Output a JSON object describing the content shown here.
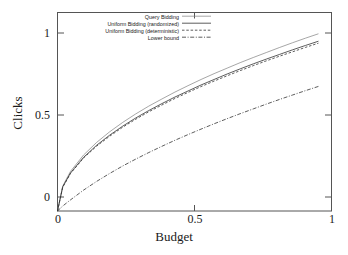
{
  "chart_data": {
    "type": "line",
    "title": "",
    "xlabel": "Budget",
    "ylabel": "Clicks",
    "xlim": [
      0,
      1.05
    ],
    "ylim": [
      0,
      1.12
    ],
    "xticks": [
      "0",
      "0.5",
      "1"
    ],
    "xtick_values": [
      0,
      0.5,
      1
    ],
    "yticks": [
      "0",
      "0.5",
      "1"
    ],
    "ytick_values": [
      0,
      0.5,
      1
    ],
    "grid": false,
    "legend_position": "top-right-inside",
    "frame": true,
    "series": [
      {
        "name": "Query Bidding",
        "style": "solid-thin",
        "color": "#808080",
        "x": [
          0,
          0.02,
          0.05,
          0.1,
          0.15,
          0.2,
          0.25,
          0.3,
          0.35,
          0.4,
          0.45,
          0.5,
          0.55,
          0.6,
          0.65,
          0.7,
          0.75,
          0.8,
          0.85,
          0.9,
          0.95,
          1.0
        ],
        "y": [
          0,
          0.141,
          0.224,
          0.316,
          0.387,
          0.447,
          0.5,
          0.548,
          0.592,
          0.632,
          0.671,
          0.707,
          0.742,
          0.775,
          0.806,
          0.837,
          0.866,
          0.894,
          0.922,
          0.949,
          0.975,
          1.0
        ]
      },
      {
        "name": "Uniform Bidding (randomized)",
        "style": "solid",
        "color": "#333333",
        "x": [
          0,
          0.02,
          0.05,
          0.1,
          0.15,
          0.2,
          0.25,
          0.3,
          0.35,
          0.4,
          0.45,
          0.5,
          0.55,
          0.6,
          0.65,
          0.7,
          0.75,
          0.8,
          0.85,
          0.9,
          0.95,
          1.0
        ],
        "y": [
          0,
          0.136,
          0.215,
          0.303,
          0.371,
          0.428,
          0.479,
          0.525,
          0.567,
          0.606,
          0.643,
          0.677,
          0.711,
          0.742,
          0.773,
          0.802,
          0.83,
          0.857,
          0.883,
          0.909,
          0.934,
          0.958
        ]
      },
      {
        "name": "Uniform Bidding (deterministic)",
        "style": "dashed",
        "color": "#333333",
        "x": [
          0,
          0.02,
          0.05,
          0.1,
          0.15,
          0.2,
          0.25,
          0.3,
          0.35,
          0.4,
          0.45,
          0.5,
          0.55,
          0.6,
          0.65,
          0.7,
          0.75,
          0.8,
          0.85,
          0.9,
          0.95,
          1.0
        ],
        "y": [
          0,
          0.134,
          0.212,
          0.299,
          0.366,
          0.422,
          0.473,
          0.518,
          0.56,
          0.598,
          0.635,
          0.669,
          0.702,
          0.733,
          0.763,
          0.792,
          0.82,
          0.847,
          0.873,
          0.898,
          0.923,
          0.947
        ]
      },
      {
        "name": "Lower bound",
        "style": "dash-dot",
        "color": "#333333",
        "x": [
          0,
          0.02,
          0.05,
          0.1,
          0.15,
          0.2,
          0.25,
          0.3,
          0.35,
          0.4,
          0.45,
          0.5,
          0.55,
          0.6,
          0.65,
          0.7,
          0.75,
          0.8,
          0.85,
          0.9,
          0.95,
          1.0
        ],
        "y": [
          0,
          0.028,
          0.063,
          0.118,
          0.167,
          0.212,
          0.254,
          0.293,
          0.33,
          0.365,
          0.399,
          0.431,
          0.462,
          0.492,
          0.521,
          0.549,
          0.576,
          0.603,
          0.629,
          0.654,
          0.679,
          0.703
        ]
      }
    ]
  },
  "legend": {
    "entries": [
      {
        "label": "Query Bidding"
      },
      {
        "label": "Uniform Bidding (randomized)"
      },
      {
        "label": "Uniform Bidding (deterministic)"
      },
      {
        "label": "Lower bound"
      }
    ]
  },
  "axes": {
    "x_title": "Budget",
    "y_title": "Clicks",
    "x_tick_labels": [
      "0",
      "0.5",
      "1"
    ],
    "y_tick_labels": [
      "0",
      "0.5",
      "1"
    ]
  }
}
